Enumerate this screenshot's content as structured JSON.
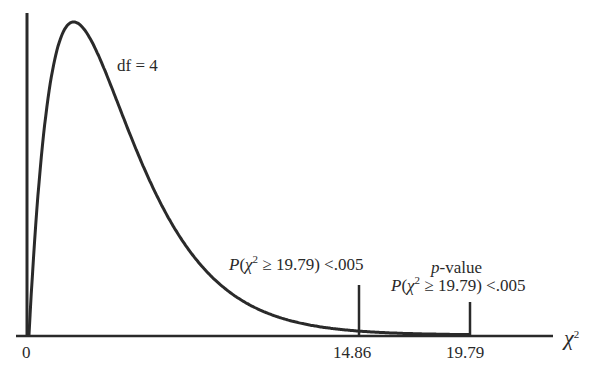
{
  "chart_data": {
    "type": "line",
    "title": "",
    "distribution": "chi-square",
    "df_label": "df = 4",
    "df": 4,
    "xlabel": "χ²",
    "ylabel": "",
    "xlim": [
      0,
      22
    ],
    "x_ticks": [
      {
        "value": 0,
        "label": "0"
      },
      {
        "value": 14.86,
        "label": "14.86"
      },
      {
        "value": 19.79,
        "label": "19.79"
      }
    ],
    "markers": [
      {
        "x": 14.86,
        "label": "P(χ² ≥ 19.79) < .005"
      },
      {
        "x": 19.79,
        "label_top": "p-value",
        "label": "P(χ² ≥ 19.79) < .005"
      }
    ],
    "curve": {
      "x": [
        0,
        0.5,
        1,
        1.5,
        2,
        2.5,
        3,
        4,
        5,
        6,
        7,
        8,
        9,
        10,
        12,
        14,
        16,
        18,
        20,
        22
      ],
      "y": [
        0,
        0.0974,
        0.1516,
        0.1771,
        0.1839,
        0.1791,
        0.1673,
        0.1353,
        0.1026,
        0.0747,
        0.0528,
        0.0366,
        0.025,
        0.0168,
        0.0074,
        0.0032,
        0.0013,
        0.0006,
        0.0002,
        0.0001
      ]
    },
    "grid": false,
    "legend": null
  },
  "labels": {
    "df": "df = 4",
    "tick_0": "0",
    "tick_1486": "14.86",
    "tick_1979": "19.79",
    "ann1_P": "P",
    "ann1_open": "(",
    "ann1_chi": "χ",
    "ann1_sup": "2",
    "ann1_rest": " ≥ 19.79) <.005",
    "ann2_p": "p",
    "ann2_value": "-value",
    "ann2_P": "P",
    "ann2_open": "(",
    "ann2_chi": "χ",
    "ann2_sup": "2",
    "ann2_rest": " ≥ 19.79) <.005",
    "axis_chi": "χ",
    "axis_sup": "2"
  },
  "colors": {
    "ink": "#2a2a2a",
    "background": "#ffffff"
  }
}
